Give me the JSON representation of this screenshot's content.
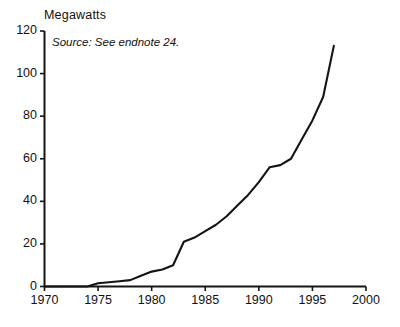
{
  "figure": {
    "y_unit_label": "Megawatts",
    "source_note": "Source: See endnote 24.",
    "line_color": "#141414",
    "axis_color": "#141414",
    "background_color": "#ffffff"
  },
  "chart_data": {
    "type": "line",
    "title": "",
    "subtitle": "",
    "xlabel": "",
    "ylabel": "Megawatts",
    "annotations": [
      "Source: See endnote 24."
    ],
    "legend": [],
    "legend_position": "none",
    "grid": false,
    "xlim": [
      1970,
      2000
    ],
    "ylim": [
      0,
      120
    ],
    "xticks": [
      1970,
      1975,
      1980,
      1985,
      1990,
      1995,
      2000
    ],
    "yticks": [
      0,
      20,
      40,
      60,
      80,
      100,
      120
    ],
    "xtick_labels": [
      "1970",
      "1975",
      "1980",
      "1985",
      "1990",
      "1995",
      "2000"
    ],
    "ytick_labels": [
      "0",
      "20",
      "40",
      "60",
      "80",
      "100",
      "120"
    ],
    "series": [
      {
        "name": "Megawatts",
        "x": [
          1970,
          1971,
          1972,
          1973,
          1974,
          1975,
          1976,
          1977,
          1978,
          1979,
          1980,
          1981,
          1982,
          1983,
          1984,
          1985,
          1986,
          1987,
          1988,
          1989,
          1990,
          1991,
          1992,
          1993,
          1994,
          1995,
          1996,
          1997
        ],
        "values": [
          0,
          0,
          0,
          0,
          0,
          1.5,
          2,
          2.5,
          3,
          5,
          7,
          8,
          10,
          21,
          23,
          26,
          29,
          33,
          38,
          43,
          49,
          56,
          57,
          60,
          69,
          78,
          89,
          113
        ]
      }
    ]
  }
}
